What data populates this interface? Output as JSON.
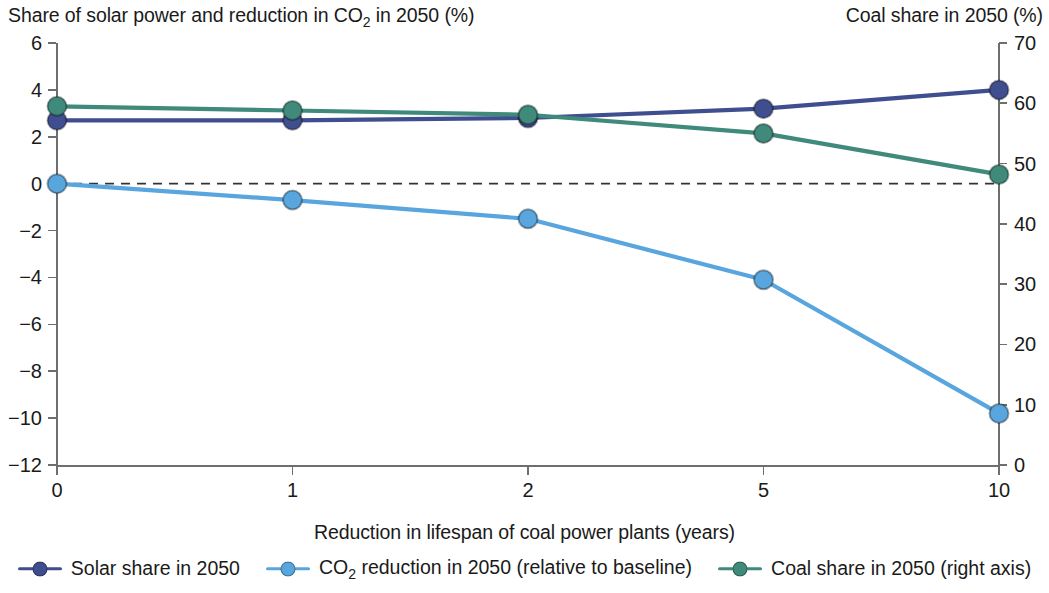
{
  "chart_data": {
    "type": "line",
    "title": "",
    "xlabel": "Reduction in lifespan of coal power plants (years)",
    "ylabel": "Share of solar power and reduction in CO2 in 2050 (%)",
    "y2label": "Coal share in 2050 (%)",
    "categories": [
      "0",
      "1",
      "2",
      "5",
      "10"
    ],
    "ylim": [
      -12,
      6
    ],
    "y2lim": [
      0,
      70
    ],
    "yticks": [
      "6",
      "4",
      "2",
      "0",
      "−2",
      "−4",
      "−6",
      "−8",
      "−10",
      "−12"
    ],
    "ytick_values": [
      6,
      4,
      2,
      0,
      -2,
      -4,
      -6,
      -8,
      -10,
      -12
    ],
    "y2ticks": [
      "70",
      "60",
      "50",
      "40",
      "30",
      "20",
      "10",
      "0"
    ],
    "y2tick_values": [
      70,
      60,
      50,
      40,
      30,
      20,
      10,
      0
    ],
    "grid": false,
    "zero_line": true,
    "legend_position": "bottom",
    "series": [
      {
        "name": "Solar share in 2050",
        "axis": "left",
        "color": "#3f4e8f",
        "values": [
          2.7,
          2.7,
          2.8,
          3.2,
          4.0
        ]
      },
      {
        "name": "CO2 reduction in 2050 (relative to baseline)",
        "axis": "left",
        "color": "#59a5dd",
        "values": [
          0.0,
          -0.7,
          -1.5,
          -4.1,
          -9.8
        ]
      },
      {
        "name": "Coal share in 2050 (right axis)",
        "axis": "right",
        "color": "#3f8a7a",
        "values": [
          59.5,
          58.8,
          58.1,
          55.0,
          48.2
        ]
      }
    ]
  },
  "titles": {
    "left_axis": "Share of solar power and reduction in CO",
    "left_axis_sub": "2",
    "left_axis_tail": " in 2050 (%)",
    "right_axis": "Coal share in 2050 (%)",
    "x_axis": "Reduction in lifespan of coal power plants (years)"
  },
  "legend": [
    {
      "label": "Solar share in 2050",
      "color": "#3f4e8f"
    },
    {
      "label_pre": "CO",
      "label_sub": "2",
      "label_post": " reduction in 2050 (relative to baseline)",
      "color": "#59a5dd"
    },
    {
      "label": "Coal share in 2050 (right axis)",
      "color": "#3f8a7a"
    }
  ],
  "colors": {
    "solar": "#3f4e8f",
    "co2": "#59a5dd",
    "coal": "#3f8a7a",
    "axis": "#6e6e6e",
    "zero_line": "#333333",
    "text": "#1a1a1a"
  }
}
